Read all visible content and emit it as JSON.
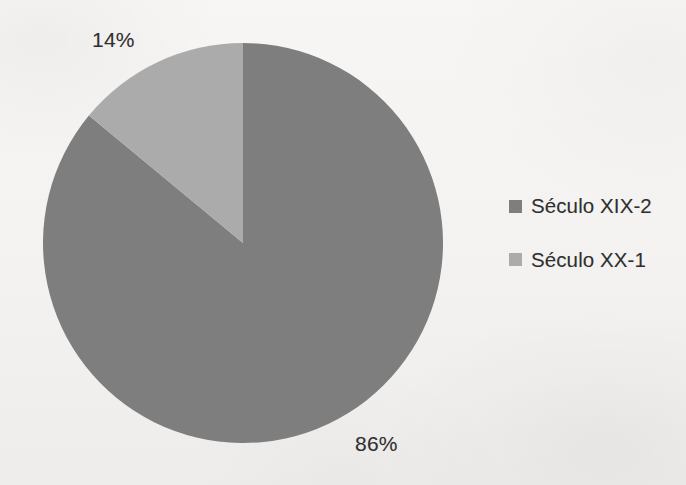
{
  "chart_data": {
    "type": "pie",
    "title": "",
    "categories": [
      "Século XIX-2",
      "Século XX-1"
    ],
    "values": [
      86,
      14
    ],
    "data_labels": [
      "86%",
      "14%"
    ],
    "unit": "%",
    "legend_position": "right",
    "grid": false,
    "start_angle_deg": 0,
    "direction": "clockwise",
    "slices": [
      {
        "name": "Século XIX-2",
        "value": 86,
        "label": "86%",
        "color": "#7e7e7e",
        "start_deg": 0,
        "end_deg": 309.6
      },
      {
        "name": "Século XX-1",
        "value": 14,
        "label": "14%",
        "color": "#ababab",
        "start_deg": 309.6,
        "end_deg": 360
      }
    ]
  },
  "labels": {
    "light_pct": "14%",
    "dark_pct": "86%"
  },
  "legend": {
    "items": [
      {
        "label": "Século XIX-2",
        "color": "#7e7e7e"
      },
      {
        "label": "Século XX-1",
        "color": "#ababab"
      }
    ]
  },
  "colors": {
    "background": "#f4f3f1",
    "slice_dark": "#7e7e7e",
    "slice_light": "#ababab",
    "text": "#2f2f2f"
  }
}
